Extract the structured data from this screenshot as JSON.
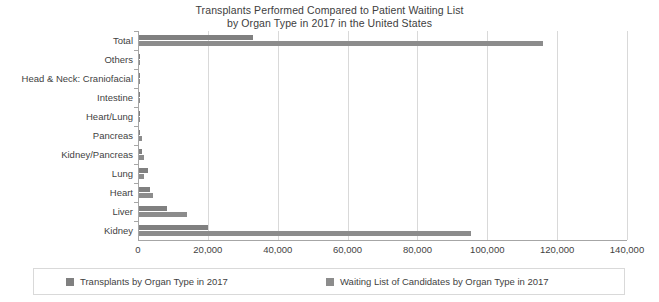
{
  "chart_data": {
    "type": "bar",
    "orientation": "horizontal",
    "title": "Transplants Performed Compared to Patient Waiting List by Organ Type in 2017 in the United States",
    "title_lines": [
      "Transplants Performed Compared to Patient Waiting List",
      "by Organ Type in 2017 in the United States"
    ],
    "xlabel": "",
    "ylabel": "",
    "xlim": [
      0,
      140000
    ],
    "grid": true,
    "legend_position": "bottom",
    "xticks": [
      0,
      20000,
      40000,
      60000,
      80000,
      100000,
      120000,
      140000
    ],
    "xtick_labels": [
      "0",
      "20,000",
      "40,000",
      "60,000",
      "80,000",
      "100,000",
      "120,000",
      "140,000"
    ],
    "categories": [
      "Total",
      "Others",
      "Head & Neck: Craniofacial",
      "Intestine",
      "Heart/Lung",
      "Pancreas",
      "Kidney/Pancreas",
      "Lung",
      "Heart",
      "Liver",
      "Kidney"
    ],
    "series": [
      {
        "name": "Transplants by Organ Type in 2017",
        "color": "#808080",
        "values": [
          32500,
          30,
          10,
          109,
          32,
          214,
          804,
          2449,
          3244,
          8082,
          19849
        ]
      },
      {
        "name": "Waiting List of Candidates by Organ Type in 2017",
        "color": "#8c8c8c",
        "values": [
          115800,
          20,
          10,
          250,
          45,
          900,
          1500,
          1400,
          3900,
          13800,
          95100
        ]
      }
    ]
  },
  "legend": {
    "entries": [
      "Transplants by Organ Type in 2017",
      "Waiting List of Candidates by Organ Type in 2017"
    ]
  },
  "colors": {
    "transplants": "#808080",
    "waiting": "#8c8c8c",
    "grid": "#d9d9d9",
    "axis": "#a6a6a6",
    "text": "#3f3f3f",
    "background": "#ffffff"
  }
}
